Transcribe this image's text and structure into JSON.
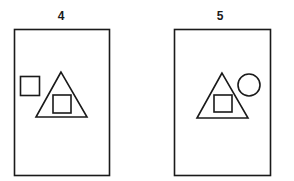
{
  "panels": [
    {
      "label": "4",
      "frame": {
        "x": 14,
        "y": 29,
        "w": 95,
        "h": 146
      },
      "shapes": [
        {
          "type": "square",
          "position": "outside-left-of-triangle"
        },
        {
          "type": "triangle",
          "contains": "square"
        }
      ]
    },
    {
      "label": "5",
      "frame": {
        "x": 174,
        "y": 29,
        "w": 96,
        "h": 146
      },
      "shapes": [
        {
          "type": "triangle",
          "contains": "square"
        },
        {
          "type": "circle",
          "position": "outside-right-of-triangle"
        }
      ]
    }
  ],
  "colors": {
    "stroke": "#1a1a1a",
    "background": "#ffffff"
  }
}
